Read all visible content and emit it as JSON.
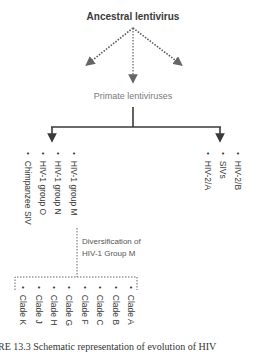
{
  "diagram": {
    "root": {
      "label": "Ancestral lentivirus"
    },
    "middle": {
      "label": "Primate lentiviruses"
    },
    "left_group": {
      "items": [
        "Chimpanzee SIV",
        "HIV-1 group O",
        "HIV-1 group N",
        "HIV-1 group M"
      ]
    },
    "right_group": {
      "items": [
        "HIV-2/A",
        "SIVs",
        "HIV-2/B"
      ]
    },
    "diversification_note": {
      "line1": "Diversification of",
      "line2": "HIV-1 Group M"
    },
    "clades": {
      "items": [
        "Clade K",
        "Clade J",
        "Clade H",
        "Clade G",
        "Clade F",
        "Clade C",
        "Clade B",
        "Clade A"
      ]
    },
    "caption_fragment": "RE 13.3  Schematic representation of evolution of HIV",
    "colors": {
      "arrow_dark": "#3a3a3a",
      "arrow_dotted": "#555555",
      "text_dark": "#3a3a3a",
      "text_muted": "#7a7a7a"
    }
  }
}
